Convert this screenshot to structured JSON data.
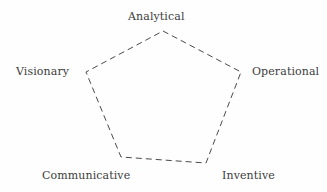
{
  "diagram": {
    "type": "pentagon-node-diagram",
    "shape_name": "pentagon",
    "background_color": "#fefefe",
    "stroke_color": "#4a4a4a",
    "text_color": "#3c3c3c",
    "stroke_style": "dashed",
    "nodes": [
      {
        "label": "Analytical",
        "position": "top",
        "x": 163,
        "y": 31
      },
      {
        "label": "Visionary",
        "position": "left",
        "x": 86,
        "y": 72
      },
      {
        "label": "Operational",
        "position": "right",
        "x": 241,
        "y": 72
      },
      {
        "label": "Communicative",
        "position": "bottom-left",
        "x": 121,
        "y": 157
      },
      {
        "label": "Inventive",
        "position": "bottom-right",
        "x": 206,
        "y": 163
      }
    ]
  },
  "chart_data": {
    "type": "diagram",
    "title": "",
    "categories": [
      "Analytical",
      "Operational",
      "Inventive",
      "Communicative",
      "Visionary"
    ],
    "values": [
      1,
      1,
      1,
      1,
      1
    ],
    "polygon_points": "163,31 241,72 206,163 121,157 86,72"
  }
}
